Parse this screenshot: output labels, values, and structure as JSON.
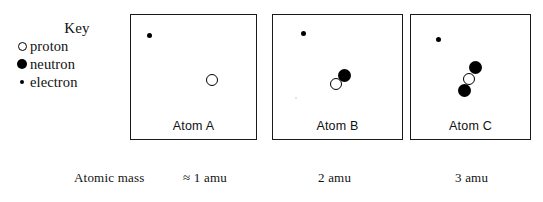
{
  "key": {
    "title": "Key",
    "items": [
      {
        "marker": "open-circle-icon",
        "label": "proton"
      },
      {
        "marker": "filled-circle-icon",
        "label": "neutron"
      },
      {
        "marker": "small-dot-icon",
        "label": "electron"
      }
    ]
  },
  "atoms": [
    {
      "id": "a",
      "label": "Atom A",
      "mass": "≈ 1 amu",
      "particles": {
        "electrons": [
          {
            "x": 16,
            "y": 18
          }
        ],
        "protons": [
          {
            "x": 75,
            "y": 59
          }
        ],
        "neutrons": []
      }
    },
    {
      "id": "b",
      "label": "Atom B",
      "mass": "2 amu",
      "particles": {
        "electrons": [
          {
            "x": 28,
            "y": 16
          }
        ],
        "protons": [
          {
            "x": 57,
            "y": 63
          }
        ],
        "neutrons": [
          {
            "x": 65,
            "y": 54
          }
        ]
      }
    },
    {
      "id": "c",
      "label": "Atom C",
      "mass": "3 amu",
      "particles": {
        "electrons": [
          {
            "x": 25,
            "y": 22
          }
        ],
        "protons": [
          {
            "x": 52,
            "y": 58
          }
        ],
        "neutrons": [
          {
            "x": 58,
            "y": 46
          },
          {
            "x": 47,
            "y": 69
          }
        ]
      }
    }
  ],
  "mass_row": {
    "label": "Atomic mass"
  },
  "colors": {
    "ink": "#111111",
    "border": "#1a1a1a",
    "background": "#ffffff"
  }
}
